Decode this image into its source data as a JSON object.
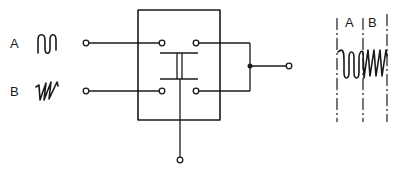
{
  "diagram": {
    "inputs": [
      {
        "label": "A",
        "waveform": "sine-like wave"
      },
      {
        "label": "B",
        "waveform": "sawtooth wave"
      }
    ],
    "output_waveform": {
      "segments": [
        "A",
        "B"
      ]
    },
    "colors": {
      "stroke": "#1a1a1a",
      "background": "#ffffff"
    }
  }
}
